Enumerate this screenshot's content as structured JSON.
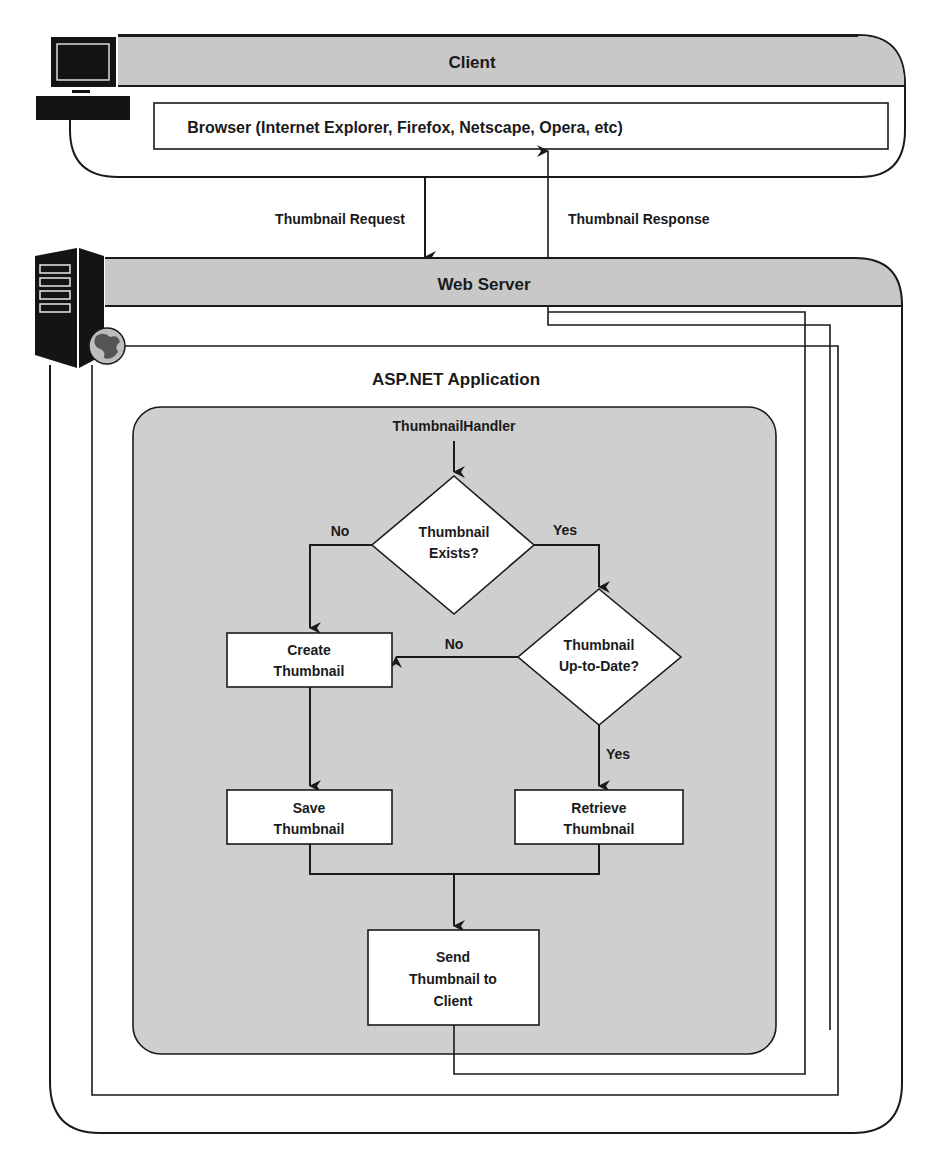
{
  "diagram": {
    "client": {
      "title": "Client",
      "browser_label": "Browser (Internet Explorer, Firefox, Netscape, Opera, etc)",
      "icon": "computer-icon"
    },
    "arrows": {
      "request_label": "Thumbnail Request",
      "response_label": "Thumbnail Response"
    },
    "web_server": {
      "title": "Web Server",
      "icon": "server-tower-icon",
      "globe_icon": "globe-icon"
    },
    "application": {
      "title": "ASP.NET Application"
    },
    "flowchart": {
      "entry": "ThumbnailHandler",
      "decision_exists": {
        "line1": "Thumbnail",
        "line2": "Exists?"
      },
      "decision_uptodate": {
        "line1": "Thumbnail",
        "line2": "Up-to-Date?"
      },
      "create": {
        "line1": "Create",
        "line2": "Thumbnail"
      },
      "save": {
        "line1": "Save",
        "line2": "Thumbnail"
      },
      "retrieve": {
        "line1": "Retrieve",
        "line2": "Thumbnail"
      },
      "send": {
        "line1": "Send",
        "line2": "Thumbnail to",
        "line3": "Client"
      },
      "labels": {
        "exists_no": "No",
        "exists_yes": "Yes",
        "uptodate_no": "No",
        "uptodate_yes": "Yes"
      }
    },
    "colors": {
      "header_fill": "#c8c8c8",
      "app_fill": "#cfcfcf",
      "stroke": "#1a1a1a",
      "box_fill": "#ffffff"
    }
  }
}
